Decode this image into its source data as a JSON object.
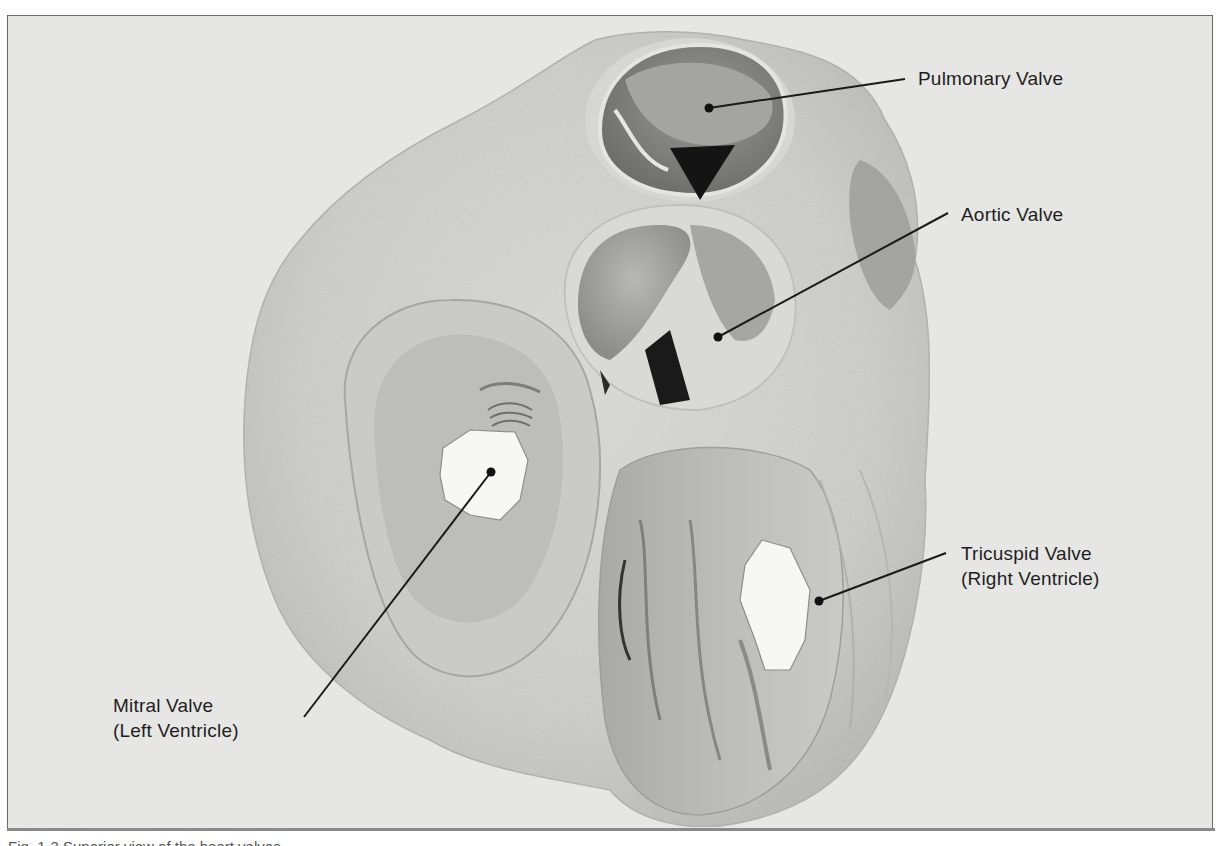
{
  "figure": {
    "background_color": "#e6e6e4",
    "frame_border_color": "#6a6a6a",
    "leader_line_color": "#1a1a1a",
    "labels": [
      {
        "id": "pulmonary",
        "lines": [
          "Pulmonary Valve"
        ],
        "pointer": {
          "dot": [
            709,
            108
          ],
          "end": [
            905,
            79
          ]
        },
        "text_pos": [
          918,
          66
        ]
      },
      {
        "id": "aortic",
        "lines": [
          "Aortic Valve"
        ],
        "pointer": {
          "dot": [
            718,
            337
          ],
          "end": [
            948,
            213
          ]
        },
        "text_pos": [
          961,
          202
        ]
      },
      {
        "id": "tricuspid",
        "lines": [
          "Tricuspid Valve",
          "(Right Ventricle)"
        ],
        "pointer": {
          "dot": [
            819,
            601
          ],
          "end": [
            946,
            553
          ]
        },
        "text_pos": [
          961,
          541
        ]
      },
      {
        "id": "mitral",
        "lines": [
          "Mitral Valve",
          "(Left Ventricle)"
        ],
        "pointer": {
          "dot": [
            491,
            472
          ],
          "end": [
            304,
            717
          ]
        },
        "text_pos": [
          113,
          693
        ]
      }
    ]
  },
  "caption": {
    "text": "Fig. 1-3  Superior view of the heart valves"
  }
}
